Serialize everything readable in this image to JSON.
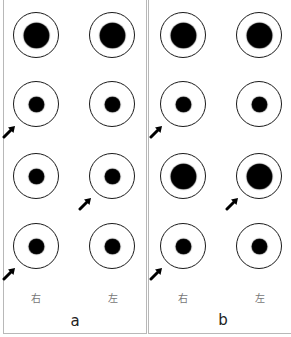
{
  "figure": {
    "panels": [
      {
        "id": "a",
        "label": "a",
        "side_labels": {
          "right": "右",
          "left": "左"
        },
        "rows": [
          {
            "right_eye": {
              "pupil": "large",
              "arrow": false
            },
            "left_eye": {
              "pupil": "large",
              "arrow": false
            }
          },
          {
            "right_eye": {
              "pupil": "small",
              "arrow": true
            },
            "left_eye": {
              "pupil": "small",
              "arrow": false
            }
          },
          {
            "right_eye": {
              "pupil": "small",
              "arrow": false
            },
            "left_eye": {
              "pupil": "small",
              "arrow": true
            }
          },
          {
            "right_eye": {
              "pupil": "small",
              "arrow": true
            },
            "left_eye": {
              "pupil": "small",
              "arrow": false
            }
          }
        ]
      },
      {
        "id": "b",
        "label": "b",
        "side_labels": {
          "right": "右",
          "left": "左"
        },
        "rows": [
          {
            "right_eye": {
              "pupil": "large",
              "arrow": false
            },
            "left_eye": {
              "pupil": "large",
              "arrow": false
            }
          },
          {
            "right_eye": {
              "pupil": "small",
              "arrow": true
            },
            "left_eye": {
              "pupil": "small",
              "arrow": false
            }
          },
          {
            "right_eye": {
              "pupil": "large",
              "arrow": false
            },
            "left_eye": {
              "pupil": "large",
              "arrow": true
            }
          },
          {
            "right_eye": {
              "pupil": "small",
              "arrow": true
            },
            "left_eye": {
              "pupil": "small",
              "arrow": false
            }
          }
        ]
      }
    ],
    "colors": {
      "outline": "#1a1a1a",
      "pupil": "#000000",
      "border": "#b8b8b8",
      "label": "#777777"
    },
    "icons": {
      "arrow": "arrow-up-right-icon"
    }
  }
}
